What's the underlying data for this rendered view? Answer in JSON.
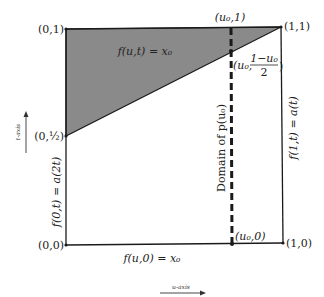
{
  "diagram": {
    "colors": {
      "shade": "#8a8a8a",
      "line": "#1a1a1a",
      "background": "#ffffff"
    },
    "corners": {
      "top_left": "(0,1)",
      "top_right": "(1,1)",
      "bottom_left": "(0,0)",
      "bottom_right": "(1,0)",
      "left_half": "(0,½)"
    },
    "points": {
      "u0_top": "(u₀,1)",
      "u0_bottom": "(u₀,0)",
      "u0_mid_prefix": "(u₀,",
      "u0_mid_numerator": "1−u₀",
      "u0_mid_denominator": "2",
      "u0_mid_suffix": ")"
    },
    "region_label": "f(u,t) = x₀",
    "edges": {
      "bottom": "f(u,0) = x₀",
      "left": "f(0,t) = a(2t)",
      "right": "f(1,t) = a(t)"
    },
    "dashed_label": "Domain of p(u₀)",
    "axes": {
      "t_axis": "t-axis",
      "u_axis": "u-axis"
    }
  }
}
